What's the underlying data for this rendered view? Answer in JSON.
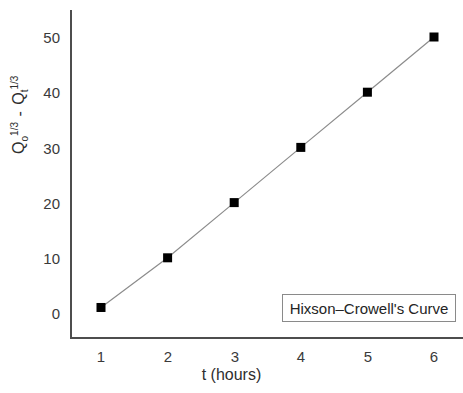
{
  "chart_data": {
    "type": "line",
    "title": "",
    "subtitle": "",
    "xlabel": "t (hours)",
    "ylabel": "Qo 1/3 - Qt 1/3",
    "ylabel_parts": {
      "q_symbol": "Q",
      "o_subscript": "o",
      "exp_1": "1/3",
      "separator": "-",
      "t_subscript": "t",
      "exp_2": "1/3"
    },
    "x": [
      1,
      2,
      3,
      4,
      5,
      6
    ],
    "values": [
      1,
      10,
      20,
      30,
      40,
      50
    ],
    "series": [
      {
        "name": "Hixson–Crowell's Curve",
        "values": [
          1,
          10,
          20,
          30,
          40,
          50
        ],
        "marker": "filled-square",
        "marker_color": "#000000",
        "line_color": "#8c8c8c"
      }
    ],
    "xtick_labels": [
      "1",
      "2",
      "3",
      "4",
      "5",
      "6"
    ],
    "ytick_labels": [
      "0",
      "10",
      "20",
      "30",
      "40",
      "50"
    ],
    "xticks": [
      1,
      2,
      3,
      4,
      5,
      6
    ],
    "yticks": [
      0,
      10,
      20,
      30,
      40,
      50
    ],
    "xlim": [
      0.55,
      6.45
    ],
    "ylim": [
      -3,
      53
    ],
    "grid": false,
    "legend_position": "lower-right",
    "axis_color": "#4d4d4d",
    "background": "#ffffff"
  },
  "legend": {
    "label": "Hixson–Crowell's Curve"
  }
}
